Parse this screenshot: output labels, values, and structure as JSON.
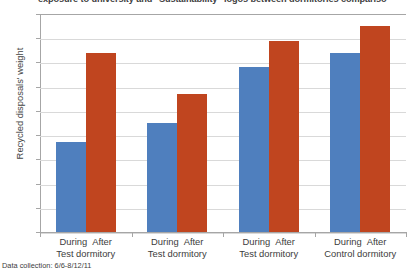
{
  "chart_data": {
    "type": "bar",
    "title": "exposure to university and \"Sustainability\" logos between dormitories compariso",
    "xlabel": "",
    "ylabel": "Recycled disposals' weight",
    "ylim": [
      0,
      9
    ],
    "yticks": [
      0,
      1,
      2,
      3,
      4,
      5,
      6,
      7,
      8,
      9
    ],
    "grid": true,
    "legend_position": "none",
    "categories": [
      "Test dormitory",
      "Test dormitory",
      "Test dormitory",
      "Control dormitory"
    ],
    "subcategories": [
      "During",
      "After"
    ],
    "series": [
      {
        "name": "During",
        "color": "#4f7fbe",
        "values": [
          3.7,
          4.5,
          6.8,
          7.4
        ]
      },
      {
        "name": "After",
        "color": "#c0451f",
        "values": [
          7.4,
          5.7,
          7.9,
          8.5
        ]
      }
    ],
    "annotation": "Data collection: 6/6-8/12/11"
  },
  "axis": {
    "y_tick_labels": [
      "9",
      "8",
      "7",
      "6",
      "5",
      "4",
      "3",
      "2",
      "1",
      "0"
    ],
    "y_title": "Recycled disposals' weight"
  },
  "groups": [
    {
      "label": "Test dormitory",
      "during_label": "During",
      "after_label": "After"
    },
    {
      "label": "Test dormitory",
      "during_label": "During",
      "after_label": "After"
    },
    {
      "label": "Test dormitory",
      "during_label": "During",
      "after_label": "After"
    },
    {
      "label": "Control dormitory",
      "during_label": "During",
      "after_label": "After"
    }
  ],
  "footer": {
    "data_collection": "Data collection: 6/6-8/12/11"
  },
  "colors": {
    "during": "#4f7fbe",
    "after": "#c0451f",
    "gridline": "#d9d9d9",
    "axis": "#a6a6a6",
    "text": "#3c3c3c"
  }
}
